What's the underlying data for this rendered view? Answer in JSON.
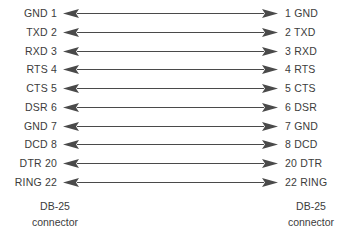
{
  "diagram": {
    "line_color": "#4a4a4a",
    "text_color": "#3c3c3c",
    "background_color": "#ffffff",
    "arrow_style": "double-headed",
    "rows": [
      {
        "left_label": "GND 1",
        "right_label": "1 GND",
        "signal": "GND",
        "pin": "1"
      },
      {
        "left_label": "TXD 2",
        "right_label": "2 TXD",
        "signal": "TXD",
        "pin": "2"
      },
      {
        "left_label": "RXD 3",
        "right_label": "3 RXD",
        "signal": "RXD",
        "pin": "3"
      },
      {
        "left_label": "RTS 4",
        "right_label": "4 RTS",
        "signal": "RTS",
        "pin": "4"
      },
      {
        "left_label": "CTS 5",
        "right_label": "5 CTS",
        "signal": "CTS",
        "pin": "5"
      },
      {
        "left_label": "DSR 6",
        "right_label": "6 DSR",
        "signal": "DSR",
        "pin": "6"
      },
      {
        "left_label": "GND 7",
        "right_label": "7 GND",
        "signal": "GND",
        "pin": "7"
      },
      {
        "left_label": "DCD 8",
        "right_label": "8 DCD",
        "signal": "DCD",
        "pin": "8"
      },
      {
        "left_label": "DTR 20",
        "right_label": "20 DTR",
        "signal": "DTR",
        "pin": "20"
      },
      {
        "left_label": "RING 22",
        "right_label": "22 RING",
        "signal": "RING",
        "pin": "22"
      }
    ],
    "left_connector": {
      "line1": "DB-25",
      "line2": "connector"
    },
    "right_connector": {
      "line1": "DB-25",
      "line2": "connector"
    }
  }
}
